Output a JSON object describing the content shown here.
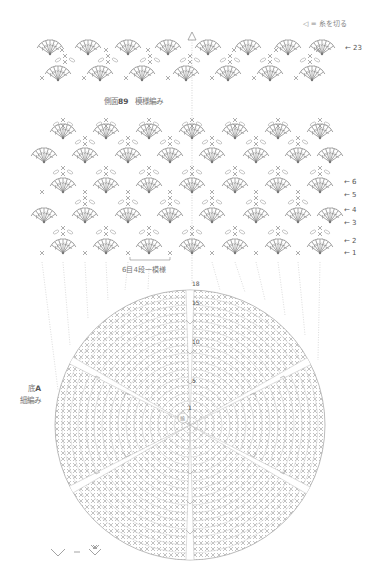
{
  "legend_top": {
    "symbol": "◁",
    "equals": "=",
    "meaning": "糸を切る"
  },
  "side_panel": {
    "title_prefix": "側面",
    "title_number": "89",
    "title_suffix": "模様編み",
    "top_row_label": "← 23",
    "row_labels": [
      "← 6",
      "← 5",
      "← 4",
      "← 3",
      "← 2",
      "← 1"
    ],
    "repeat_note": "6目4段一模様"
  },
  "base_panel": {
    "title_line1_prefix": "底",
    "title_line1_bold": "A",
    "title_line2": "細編み",
    "round_markers": [
      "18",
      "15",
      "10",
      "5",
      "1"
    ],
    "center_label": "輪"
  },
  "legend_bottom": {
    "symbol_left": "∨",
    "equals": "=",
    "symbol_right": "⩔"
  },
  "colors": {
    "line": "#9a9a9a",
    "text": "#666666",
    "background": "#ffffff"
  }
}
